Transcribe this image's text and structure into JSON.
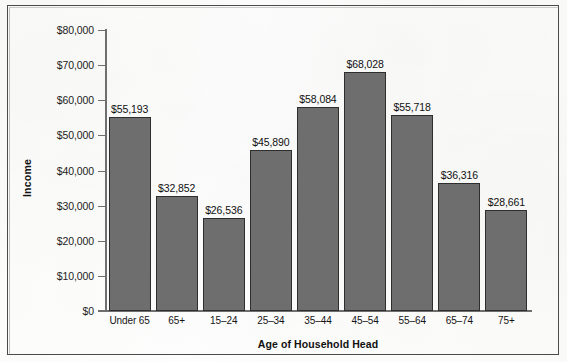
{
  "chart_data": {
    "type": "bar",
    "title": "",
    "subtitle": "",
    "xlabel": "Age of Household Head",
    "ylabel": "Income",
    "categories": [
      "Under 65",
      "65+",
      "15–24",
      "25–34",
      "35–44",
      "45–54",
      "55–64",
      "65–74",
      "75+"
    ],
    "values": [
      55193,
      32852,
      26536,
      45890,
      58084,
      68028,
      55718,
      36316,
      28661
    ],
    "value_labels": [
      "$55,193",
      "$32,852",
      "$26,536",
      "$45,890",
      "$58,084",
      "$68,028",
      "$55,718",
      "$36,316",
      "$28,661"
    ],
    "ylim": [
      0,
      80000
    ],
    "ytick_values": [
      0,
      10000,
      20000,
      30000,
      40000,
      50000,
      60000,
      70000,
      80000
    ],
    "ytick_labels": [
      "$0",
      "$10,000",
      "$20,000",
      "$30,000",
      "$40,000",
      "$50,000",
      "$60,000",
      "$70,000",
      "$80,000"
    ],
    "grid": false,
    "legend": false,
    "legend_position": "none",
    "bar_color": "#6e6e6e",
    "bar_edge_color": "#2e2e2e",
    "axis_color": "#6f6f6f",
    "background_color": "#fdfdfb",
    "frame_color": "#4a4a4a"
  }
}
